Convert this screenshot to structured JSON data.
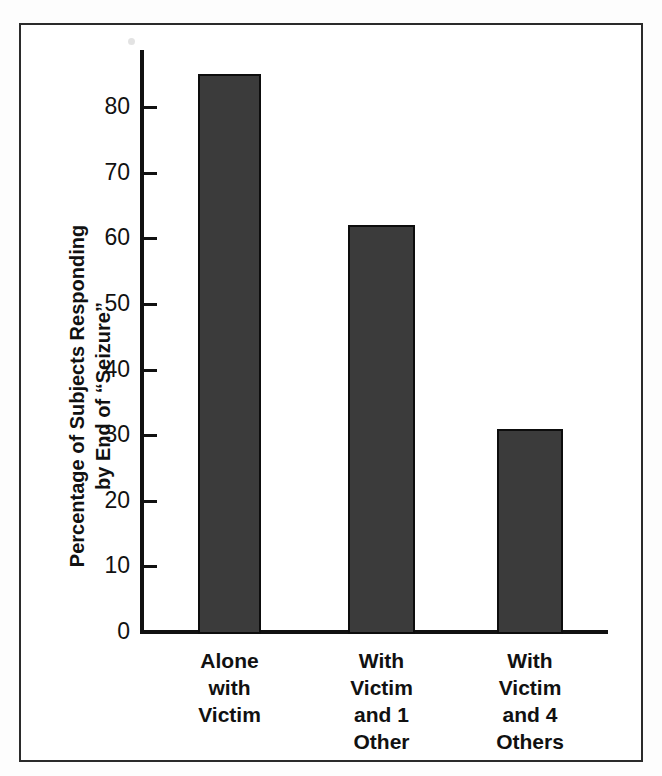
{
  "figure": {
    "background_color": "#ffffff",
    "frame_color": "#2b2b2b",
    "axis_color": "#111111"
  },
  "chart_data": {
    "type": "bar",
    "title": "",
    "subtitle": "",
    "categories": [
      "Alone\nwith\nVictim",
      "With\nVictim\nand 1\nOther",
      "With\nVictim\nand 4\nOthers"
    ],
    "values": [
      85,
      62,
      31
    ],
    "xlabel": "",
    "ylabel": "Percentage of Subjects Responding\nby End of “Seizure”",
    "ylim": [
      0,
      88
    ],
    "yticks": [
      0,
      10,
      20,
      30,
      40,
      50,
      60,
      70,
      80
    ],
    "ytick_labels": [
      "0",
      "10",
      "20",
      "30",
      "40",
      "50",
      "60",
      "70",
      "80"
    ],
    "grid": false,
    "legend": null,
    "bar_color": "#3b3b3b",
    "bar_edge_color": "#0d0d0d"
  },
  "axes": {
    "y_title_line1": "Percentage of Subjects Responding",
    "y_title_line2": "by End of “Seizure”"
  }
}
